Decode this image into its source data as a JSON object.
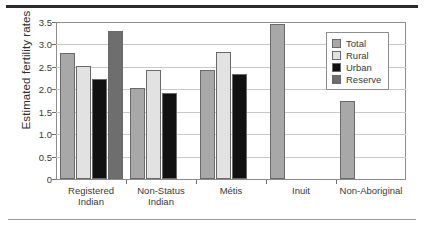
{
  "chart_data": {
    "type": "bar",
    "title": "",
    "xlabel": "",
    "ylabel": "Estimated fertility rates",
    "ylim": [
      0,
      3.5
    ],
    "ytick_labels": [
      "0",
      "0.5",
      "1.0",
      "1.5",
      "2.0",
      "2.5",
      "3.0",
      "3.5"
    ],
    "ytick_values": [
      0,
      0.5,
      1.0,
      1.5,
      2.0,
      2.5,
      3.0,
      3.5
    ],
    "grid": true,
    "legend_position": "top-right",
    "categories": [
      "Registered\nIndian",
      "Non-Status\nIndian",
      "Métis",
      "Inuit",
      "Non-Aboriginal"
    ],
    "series": [
      {
        "name": "Total",
        "color": "#a8a8a8",
        "values": [
          2.8,
          2.02,
          2.44,
          3.45,
          1.73
        ]
      },
      {
        "name": "Rural",
        "color": "#e2e2e2",
        "values": [
          2.51,
          2.43,
          2.83,
          null,
          null
        ]
      },
      {
        "name": "Urban",
        "color": "#111111",
        "values": [
          2.22,
          1.92,
          2.34,
          null,
          null
        ]
      },
      {
        "name": "Reserve",
        "color": "#6e6e6e",
        "values": [
          3.31,
          null,
          null,
          null,
          null
        ]
      }
    ]
  }
}
